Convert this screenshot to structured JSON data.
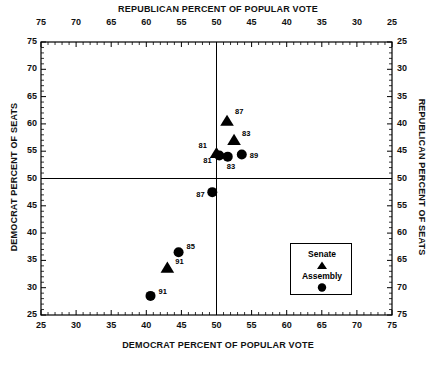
{
  "chart_data": {
    "type": "scatter",
    "title": "",
    "xlabel": "DEMOCRAT PERCENT OF POPULAR VOTE",
    "ylabel": "DEMOCRAT PERCENT OF SEATS",
    "x2label": "REPUBLICAN PERCENT OF POPULAR VOTE",
    "y2label": "REPUBLICAN PERCENT OF SEATS",
    "xlim": [
      25,
      75
    ],
    "ylim": [
      25,
      75
    ],
    "x2lim": [
      75,
      25
    ],
    "y2lim": [
      25,
      75
    ],
    "grid": false,
    "minor_ticks": true,
    "reference_lines": [
      {
        "type": "vertical",
        "value": 50
      },
      {
        "type": "horizontal",
        "value": 50
      }
    ],
    "xticks": [
      25,
      30,
      35,
      40,
      45,
      50,
      55,
      60,
      65,
      70,
      75
    ],
    "yticks": [
      25,
      30,
      35,
      40,
      45,
      50,
      55,
      60,
      65,
      70,
      75
    ],
    "x2ticks": [
      75,
      70,
      65,
      60,
      55,
      50,
      45,
      40,
      35,
      30,
      25
    ],
    "y2ticks": [
      25,
      30,
      35,
      40,
      45,
      50,
      55,
      60,
      65,
      70,
      75
    ],
    "legend_position": "lower right",
    "series": [
      {
        "name": "Senate",
        "marker": "triangle",
        "color": "#000000",
        "points": [
          {
            "label": "87",
            "x": 51.5,
            "y": 60.5,
            "label_dx": 8,
            "label_dy": -10
          },
          {
            "label": "83",
            "x": 52.5,
            "y": 57.0,
            "label_dx": 8,
            "label_dy": -7
          },
          {
            "label": "81",
            "x": 50.0,
            "y": 54.6,
            "label_dx": -18,
            "label_dy": -8
          },
          {
            "label": "91",
            "x": 43.0,
            "y": 33.6,
            "label_dx": 8,
            "label_dy": -7
          }
        ]
      },
      {
        "name": "Assembly",
        "marker": "circle",
        "color": "#000000",
        "points": [
          {
            "label": "81",
            "x": 50.4,
            "y": 54.2,
            "label_dx": -16,
            "label_dy": 4
          },
          {
            "label": "83",
            "x": 51.6,
            "y": 54.0,
            "label_dx": -1,
            "label_dy": 9
          },
          {
            "label": "89",
            "x": 53.6,
            "y": 54.4,
            "label_dx": 8,
            "label_dy": 1
          },
          {
            "label": "87",
            "x": 49.4,
            "y": 47.5,
            "label_dx": -16,
            "label_dy": 2
          },
          {
            "label": "85",
            "x": 44.6,
            "y": 36.5,
            "label_dx": 8,
            "label_dy": -6
          },
          {
            "label": "91",
            "x": 40.6,
            "y": 28.5,
            "label_dx": 8,
            "label_dy": -5
          }
        ]
      }
    ]
  },
  "legend": {
    "items": [
      {
        "label": "Senate",
        "marker": "triangle"
      },
      {
        "label": "Assembly",
        "marker": "circle"
      }
    ]
  }
}
